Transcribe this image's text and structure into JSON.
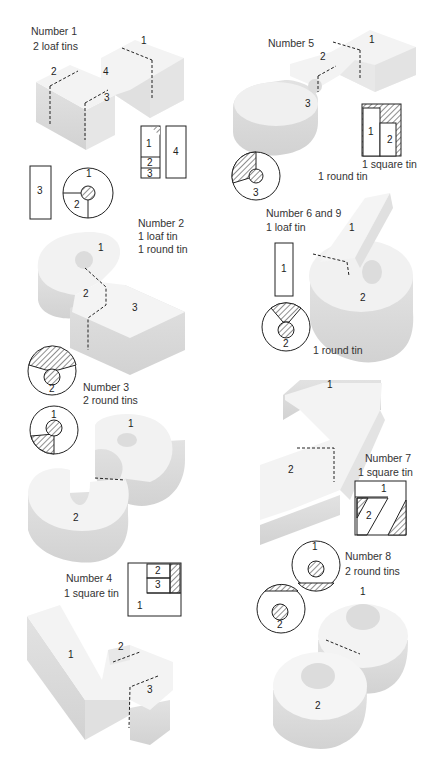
{
  "figures": {
    "n1": {
      "title": "Number 1",
      "tins": "2 loaf tins",
      "pieces": [
        "1",
        "2",
        "3",
        "4"
      ]
    },
    "n2": {
      "title": "Number 2",
      "tins_a": "1 loaf tin",
      "tins_b": "1 round tin",
      "pieces": [
        "1",
        "2",
        "3"
      ]
    },
    "n3": {
      "title": "Number 3",
      "tins": "2 round tins",
      "pieces": [
        "1",
        "2"
      ]
    },
    "n4": {
      "title": "Number 4",
      "tins": "1 square tin",
      "pieces": [
        "1",
        "2",
        "3"
      ]
    },
    "n5": {
      "title": "Number 5",
      "tin_square": "1 square tin",
      "tin_round": "1 round tin",
      "pieces": [
        "1",
        "2",
        "3"
      ]
    },
    "n69": {
      "title": "Number 6 and 9",
      "tins": "1 loaf tin",
      "tin_round": "1 round tin",
      "pieces": [
        "1",
        "2"
      ]
    },
    "n7": {
      "title": "Number 7",
      "tins": "1 square tin",
      "pieces": [
        "1",
        "2"
      ]
    },
    "n8": {
      "title": "Number 8",
      "tins": "2 round tins",
      "pieces": [
        "1",
        "2"
      ]
    }
  },
  "colors": {
    "cake_top": "#f2f2f2",
    "cake_side": "#dcdcdc",
    "cake_shadow": "#cfcfcf",
    "line": "#222222",
    "hatch": "#444444"
  }
}
